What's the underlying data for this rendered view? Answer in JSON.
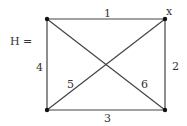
{
  "graph": {
    "name": "H",
    "name_label": "H =",
    "vertex_marker": "x",
    "colors": {
      "edge": "#444444",
      "vertex": "#111111",
      "text": "#333333"
    },
    "vertices": [
      {
        "id": "tl",
        "x": 47,
        "y": 19
      },
      {
        "id": "tr",
        "x": 165,
        "y": 19
      },
      {
        "id": "bl",
        "x": 47,
        "y": 110
      },
      {
        "id": "br",
        "x": 165,
        "y": 110
      }
    ],
    "edges": [
      {
        "label": "1",
        "from": "tl",
        "to": "tr"
      },
      {
        "label": "2",
        "from": "tr",
        "to": "br"
      },
      {
        "label": "3",
        "from": "bl",
        "to": "br"
      },
      {
        "label": "4",
        "from": "tl",
        "to": "bl"
      },
      {
        "label": "5",
        "from": "bl",
        "to": "tr"
      },
      {
        "label": "6",
        "from": "tl",
        "to": "br"
      }
    ]
  }
}
